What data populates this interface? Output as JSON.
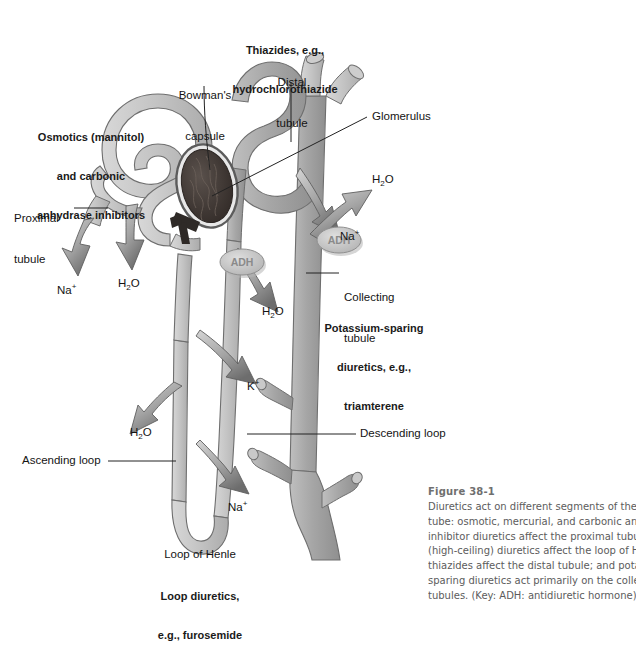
{
  "figure": {
    "number": "Figure 38-1",
    "caption_lines": [
      "Diuretics act on different segments of the",
      "tube: osmotic, mercurial, and carbonic an",
      "inhibitor diuretics affect the proximal tubul",
      "(high-ceiling) diuretics affect the loop of H",
      "thiazides affect the distal tubule; and pota",
      "sparing diuretics act primarily on the colle",
      "tubules. (Key: ADH: antidiuretic hormone)"
    ]
  },
  "colors": {
    "tubule_fill": "#a9a9a9",
    "tubule_light": "#c9c9c9",
    "tubule_outline": "#6e6e6e",
    "glomerulus_dark": "#3a3330",
    "arrow_fill": "#9a9a9a",
    "arrow_head": "#6a6a6a",
    "adh_fill": "#c4c4c4",
    "text": "#141414",
    "caption_text": "#5c5c5c",
    "caption_heading": "#6f6f6f",
    "leader_line": "#222222",
    "background": "#ffffff"
  },
  "drug_labels": [
    {
      "id": "thiazides",
      "lines": [
        "Thiazides, e.g.,",
        "hydrochlorothiazide"
      ],
      "target": "distal tubule"
    },
    {
      "id": "osmotics",
      "lines": [
        "Osmotics (mannitol)",
        "and carbonic",
        "anhydrase inhibitors"
      ],
      "target": "proximal tubule"
    },
    {
      "id": "potassium-sparing",
      "lines": [
        "Potassium-sparing",
        "diuretics, e.g.,",
        "triamterene"
      ],
      "target": "collecting tubule"
    },
    {
      "id": "loop-diuretics",
      "lines": [
        "Loop diuretics,",
        "e.g., furosemide"
      ],
      "target": "loop of Henle"
    }
  ],
  "structure_labels": [
    {
      "id": "bowmans-capsule",
      "lines": [
        "Bowman's",
        "capsule"
      ]
    },
    {
      "id": "distal-tubule",
      "lines": [
        "Distal",
        "tubule"
      ]
    },
    {
      "id": "glomerulus",
      "lines": [
        "Glomerulus"
      ]
    },
    {
      "id": "proximal-tubule",
      "lines": [
        "Proximal",
        "tubule"
      ]
    },
    {
      "id": "collecting-tubule",
      "lines": [
        "Collecting",
        "tubule"
      ]
    },
    {
      "id": "descending-loop",
      "lines": [
        "Descending loop"
      ]
    },
    {
      "id": "ascending-loop",
      "lines": [
        "Ascending loop"
      ]
    },
    {
      "id": "loop-of-henle",
      "lines": [
        "Loop of Henle"
      ]
    }
  ],
  "ion_labels": [
    {
      "id": "na-proximal",
      "species": "Na",
      "charge": "+",
      "text": "Na+"
    },
    {
      "id": "h2o-proximal",
      "species": "H2O",
      "charge": "",
      "text": "H2O"
    },
    {
      "id": "na-distal",
      "species": "Na",
      "charge": "+",
      "text": "Na+"
    },
    {
      "id": "h2o-collecting",
      "species": "H2O",
      "charge": "",
      "text": "H2O"
    },
    {
      "id": "h2o-distal",
      "species": "H2O",
      "charge": "",
      "text": "H2O"
    },
    {
      "id": "k-ascending",
      "species": "K",
      "charge": "+",
      "text": "K+"
    },
    {
      "id": "h2o-descending",
      "species": "H2O",
      "charge": "",
      "text": "H2O"
    },
    {
      "id": "na-ascending",
      "species": "Na",
      "charge": "+",
      "text": "Na+"
    }
  ],
  "adh_markers": [
    {
      "id": "adh-distal",
      "label": "ADH"
    },
    {
      "id": "adh-collecting",
      "label": "ADH"
    }
  ]
}
